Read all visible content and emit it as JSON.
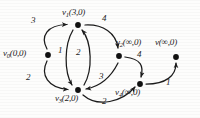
{
  "figure": {
    "type": "directed-weighted-graph",
    "ink_color": "#1b1b1b",
    "background_color": "#fdfdfc"
  },
  "nodes": [
    {
      "id": "v0",
      "name": "v",
      "subscript": "0",
      "value": "(0,0)",
      "label": "v0(0,0)",
      "x": 48,
      "y": 55,
      "label_x": 3,
      "label_y": 49,
      "label_anchor": "left"
    },
    {
      "id": "v1",
      "name": "v",
      "subscript": "1",
      "value": "(3,0)",
      "label": "v1(3,0)",
      "x": 78,
      "y": 25,
      "label_x": 62,
      "label_y": 8,
      "label_anchor": "left"
    },
    {
      "id": "v2",
      "name": "v",
      "subscript": "2",
      "value": "(∞,0)",
      "label": "v2(∞,0)",
      "x": 119,
      "y": 56,
      "label_x": 116,
      "label_y": 38,
      "label_anchor": "left"
    },
    {
      "id": "v3",
      "name": "v",
      "subscript": "3",
      "value": "(2,0)",
      "label": "v3(2,0)",
      "x": 78,
      "y": 90,
      "label_x": 55,
      "label_y": 94,
      "label_anchor": "left"
    },
    {
      "id": "v4",
      "name": "v",
      "subscript": "4",
      "value": "(∞,0)",
      "label": "v4(∞,0)",
      "x": 140,
      "y": 84,
      "label_x": 115,
      "label_y": 88,
      "label_anchor": "left"
    },
    {
      "id": "v5",
      "name": "v",
      "subscript": "",
      "value": "(∞,0)",
      "label": "v(∞,0)",
      "x": 176,
      "y": 57,
      "label_x": 156,
      "label_y": 38,
      "label_anchor": "left"
    }
  ],
  "edges": [
    {
      "id": "e0",
      "from": "v0",
      "to": "v1",
      "weight": "3",
      "weight_x": 33,
      "weight_y": 21
    },
    {
      "id": "e1",
      "from": "v0",
      "to": "v3",
      "weight": "2",
      "weight_x": 28,
      "weight_y": 78
    },
    {
      "id": "e2",
      "from": "v1",
      "to": "v3",
      "weight": "1",
      "weight_x": 60,
      "weight_y": 50
    },
    {
      "id": "e3",
      "from": "v3",
      "to": "v1",
      "weight": "2",
      "weight_x": 78,
      "weight_y": 52
    },
    {
      "id": "e4",
      "from": "v1",
      "to": "v2",
      "weight": "4",
      "weight_x": 104,
      "weight_y": 19
    },
    {
      "id": "e5",
      "from": "v2",
      "to": "v4",
      "weight": "4",
      "weight_x": 139,
      "weight_y": 55
    },
    {
      "id": "e6",
      "from": "v2",
      "to": "v3",
      "weight": "3",
      "weight_x": 101,
      "weight_y": 77
    },
    {
      "id": "e7",
      "from": "v3",
      "to": "v4",
      "weight": "2",
      "weight_x": 104,
      "weight_y": 102
    },
    {
      "id": "e8",
      "from": "v4",
      "to": "v5",
      "weight": "1",
      "weight_x": 168,
      "weight_y": 83
    }
  ]
}
